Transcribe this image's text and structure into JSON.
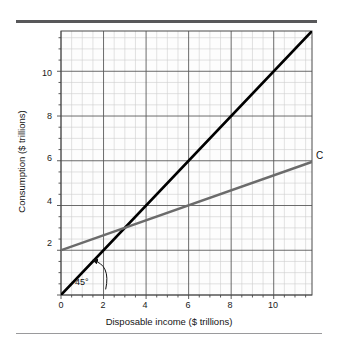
{
  "figure": {
    "background_color": "#ffffff",
    "rule_color_top": "#58585a",
    "rule_color_bottom": "#9a9a9c"
  },
  "chart_data": {
    "type": "line",
    "title": "",
    "xlabel": "Disposable income ($ trillions)",
    "ylabel": "Consumption ($ trillions)",
    "xlim": [
      0,
      11.8
    ],
    "ylim": [
      0,
      11.8
    ],
    "xticks": [
      0,
      2,
      4,
      6,
      8,
      10
    ],
    "xtick_labels": [
      "0",
      "2",
      "4",
      "6",
      "8",
      "10"
    ],
    "yticks": [
      2,
      4,
      6,
      8,
      10
    ],
    "ytick_labels": [
      "2",
      "4",
      "6",
      "8",
      "10"
    ],
    "grid": true,
    "grid_major_step": 2,
    "grid_minor_step": 0.5,
    "grid_major_color": "#595959",
    "grid_minor_color": "#c9c9c9",
    "legend_position": "inline-right",
    "series": [
      {
        "name": "45-degree line",
        "label": "45°",
        "color": "#000000",
        "width": 2.6,
        "x": [
          0,
          11.8
        ],
        "values": [
          0,
          11.8
        ],
        "intercept": 0,
        "slope": 1
      },
      {
        "name": "Consumption function",
        "label": "C",
        "color": "#6b6b6b",
        "width": 2.4,
        "x": [
          0,
          11.8
        ],
        "values": [
          2,
          5.95
        ],
        "intercept": 2,
        "slope": 0.3347
      }
    ],
    "annotations": [
      {
        "name": "angle-annotation",
        "text": "45°",
        "x": 0.75,
        "y": 0.55,
        "arrow_to": {
          "x": 1.5,
          "y": 1.55
        },
        "arrow_from": {
          "x": 2.1,
          "y": 0.25
        }
      },
      {
        "name": "curve-label-C",
        "text": "C",
        "x": 12.1,
        "y": 6.1
      }
    ],
    "intersection": {
      "x": 3.0,
      "y": 3.0
    }
  },
  "labels": {
    "axis_x_title": "Disposable income ($ trillions)",
    "axis_y_title": "Consumption ($ trillions)",
    "curve_c": "C",
    "angle": "45°",
    "x0": "0",
    "x2": "2",
    "x4": "4",
    "x6": "6",
    "x8": "8",
    "x10": "10",
    "y2": "2",
    "y4": "4",
    "y6": "6",
    "y8": "8",
    "y10": "10"
  }
}
